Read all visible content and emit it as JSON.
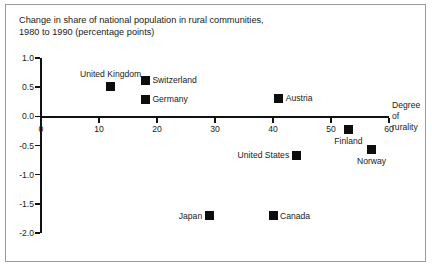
{
  "chart_data": {
    "type": "scatter",
    "title": "Change in share of national population in rural communities,\n1980 to 1990 (percentage points)",
    "xlabel": "Degree\nof\nrurality",
    "ylabel": "",
    "xlim": [
      0,
      60
    ],
    "ylim": [
      -2.0,
      1.0
    ],
    "xticks": [
      0,
      10,
      20,
      30,
      40,
      50,
      60
    ],
    "xtick_labels": [
      "0",
      "10",
      "20",
      "30",
      "40",
      "50",
      "60"
    ],
    "yticks": [
      1.0,
      0.5,
      0.0,
      -0.5,
      -1.0,
      -1.5,
      -2.0
    ],
    "ytick_labels": [
      "1.0",
      "0.5",
      "0.0",
      "-0.5",
      "-1.0",
      "-1.5",
      "-2.0"
    ],
    "grid": false,
    "legend": "none",
    "marker_color": "#0d0d0d",
    "axis_color": "#111111",
    "points": [
      {
        "label": "United Kingdom",
        "x": 12,
        "y": 0.52,
        "label_pos": "above"
      },
      {
        "label": "Switzerland",
        "x": 18,
        "y": 0.62,
        "label_pos": "right"
      },
      {
        "label": "Germany",
        "x": 18,
        "y": 0.29,
        "label_pos": "right"
      },
      {
        "label": "Austria",
        "x": 41,
        "y": 0.31,
        "label_pos": "right"
      },
      {
        "label": "Finland",
        "x": 53,
        "y": -0.23,
        "label_pos": "below"
      },
      {
        "label": "Norway",
        "x": 57,
        "y": -0.57,
        "label_pos": "below"
      },
      {
        "label": "United States",
        "x": 44,
        "y": -0.67,
        "label_pos": "left"
      },
      {
        "label": "Japan",
        "x": 29,
        "y": -1.7,
        "label_pos": "left"
      },
      {
        "label": "Canada",
        "x": 40,
        "y": -1.7,
        "label_pos": "right"
      }
    ]
  }
}
